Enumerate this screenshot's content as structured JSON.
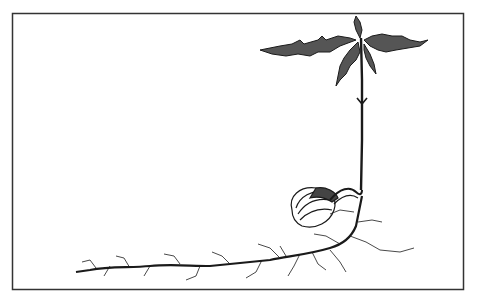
{
  "illustration": {
    "subject": "Acorn seedling (oak) germinating with roots and first leaves",
    "style": "black ink pen drawing on white",
    "frame": {
      "x": 12,
      "y": 13,
      "width": 451,
      "height": 276,
      "stroke": "#333333"
    },
    "colors": {
      "ink": "#1a1a1a",
      "paper": "#ffffff"
    },
    "parts": [
      {
        "name": "leaves",
        "label": "Oak leaves"
      },
      {
        "name": "stem",
        "label": "Stem"
      },
      {
        "name": "acorn",
        "label": "Acorn"
      },
      {
        "name": "roots",
        "label": "Roots"
      }
    ]
  }
}
